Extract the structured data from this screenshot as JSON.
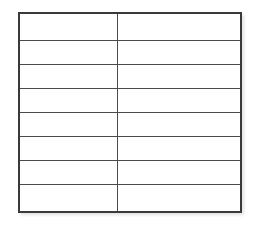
{
  "table": {
    "columns": 2,
    "rows": [
      [
        "",
        ""
      ],
      [
        "",
        ""
      ],
      [
        "",
        ""
      ],
      [
        "",
        ""
      ],
      [
        "",
        ""
      ],
      [
        "",
        ""
      ],
      [
        "",
        ""
      ],
      [
        "",
        ""
      ]
    ]
  },
  "colors": {
    "border": "#3a3a3a",
    "grid_line": "#4a4a4a",
    "background": "#ffffff"
  }
}
